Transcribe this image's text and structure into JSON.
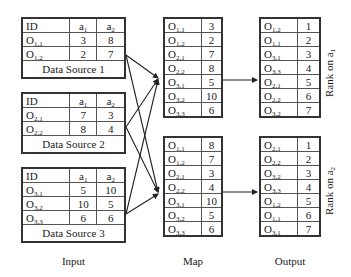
{
  "input": {
    "label": "Input",
    "sources": [
      {
        "caption": "Data Source 1",
        "headers": [
          "ID",
          "a1",
          "a2"
        ],
        "rows": [
          {
            "id_main": "O",
            "id_sub": "1,1",
            "a1": "3",
            "a2": "8"
          },
          {
            "id_main": "O",
            "id_sub": "1,2",
            "a1": "2",
            "a2": "7"
          }
        ]
      },
      {
        "caption": "Data Source 2",
        "headers": [
          "ID",
          "a1",
          "a2"
        ],
        "rows": [
          {
            "id_main": "O",
            "id_sub": "2,1",
            "a1": "7",
            "a2": "3"
          },
          {
            "id_main": "O",
            "id_sub": "2,2",
            "a1": "8",
            "a2": "4"
          }
        ]
      },
      {
        "caption": "Data Source 3",
        "headers": [
          "ID",
          "a1",
          "a2"
        ],
        "rows": [
          {
            "id_main": "O",
            "id_sub": "3,1",
            "a1": "5",
            "a2": "10"
          },
          {
            "id_main": "O",
            "id_sub": "3,2",
            "a1": "10",
            "a2": "5"
          },
          {
            "id_main": "O",
            "id_sub": "3,3",
            "a1": "6",
            "a2": "6"
          }
        ]
      }
    ]
  },
  "map": {
    "label": "Map",
    "tables": [
      {
        "rows": [
          {
            "id_sub": "1,1",
            "v": "3"
          },
          {
            "id_sub": "1,2",
            "v": "2"
          },
          {
            "id_sub": "2,1",
            "v": "7"
          },
          {
            "id_sub": "2,2",
            "v": "8"
          },
          {
            "id_sub": "3,1",
            "v": "5"
          },
          {
            "id_sub": "3,2",
            "v": "10"
          },
          {
            "id_sub": "3,3",
            "v": "6"
          }
        ]
      },
      {
        "rows": [
          {
            "id_sub": "1,1",
            "v": "8"
          },
          {
            "id_sub": "1,2",
            "v": "7"
          },
          {
            "id_sub": "2,1",
            "v": "3"
          },
          {
            "id_sub": "2,2",
            "v": "4"
          },
          {
            "id_sub": "3,1",
            "v": "10"
          },
          {
            "id_sub": "3,2",
            "v": "5"
          },
          {
            "id_sub": "3,3",
            "v": "6"
          }
        ]
      }
    ]
  },
  "output": {
    "label": "Output",
    "tables": [
      {
        "rank_label_main": "Rank on a",
        "rank_label_sub": "1",
        "rows": [
          {
            "id_sub": "1,2",
            "v": "1"
          },
          {
            "id_sub": "1,1",
            "v": "2"
          },
          {
            "id_sub": "3,1",
            "v": "3"
          },
          {
            "id_sub": "3,3",
            "v": "4"
          },
          {
            "id_sub": "2,1",
            "v": "5"
          },
          {
            "id_sub": "2,2",
            "v": "6"
          },
          {
            "id_sub": "3,2",
            "v": "7"
          }
        ]
      },
      {
        "rank_label_main": "Rank on a",
        "rank_label_sub": "2",
        "rows": [
          {
            "id_sub": "2,1",
            "v": "1"
          },
          {
            "id_sub": "2,2",
            "v": "2"
          },
          {
            "id_sub": "3,2",
            "v": "3"
          },
          {
            "id_sub": "3,3",
            "v": "4"
          },
          {
            "id_sub": "1,2",
            "v": "5"
          },
          {
            "id_sub": "1,1",
            "v": "6"
          },
          {
            "id_sub": "3,1",
            "v": "7"
          }
        ]
      }
    ]
  },
  "common": {
    "obj_letter": "O",
    "attr_letter": "a",
    "id_header": "ID",
    "a1_sub": "1",
    "a2_sub": "2"
  }
}
